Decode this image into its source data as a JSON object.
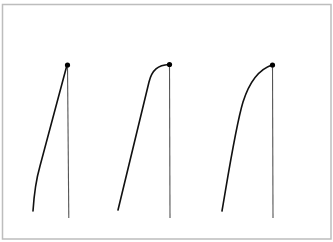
{
  "diagram": {
    "title": "",
    "colors": {
      "background": "#ffffff",
      "frame": "#bdbdbd",
      "curve": "#111111",
      "vertical_line": "#555555",
      "point": "#000000"
    },
    "panels": [
      {
        "id": "panel-1",
        "curve_shape": "near-linear rise, slight concave start",
        "has_endpoint_marker": true,
        "has_vertical_line": true
      },
      {
        "id": "panel-2",
        "curve_shape": "linear rise then rounded plateau near the top",
        "has_endpoint_marker": true,
        "has_vertical_line": true
      },
      {
        "id": "panel-3",
        "curve_shape": "smooth concave-down arc",
        "has_endpoint_marker": true,
        "has_vertical_line": true
      }
    ]
  }
}
